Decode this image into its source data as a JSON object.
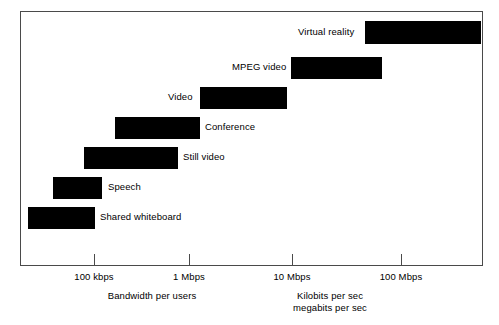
{
  "chart_data": {
    "type": "bar",
    "orientation": "horizontal",
    "title": "",
    "xlabel": "Bandwidth per users",
    "ylabel": "",
    "scale": "log",
    "xlim": [
      20000,
      500000000
    ],
    "grid": false,
    "legend": null,
    "axis_ticks": [
      {
        "label": "100 kbps",
        "value": 100000,
        "x": 94
      },
      {
        "label": "1 Mbps",
        "value": 1000000,
        "x": 189
      },
      {
        "label": "10 Mbps",
        "value": 10000000,
        "x": 292
      },
      {
        "label": "100 Mbps",
        "value": 100000000,
        "x": 401
      }
    ],
    "captions": [
      {
        "text": "Bandwidth per users",
        "x": 152,
        "y": 290
      },
      {
        "text": "Kilobits per sec",
        "x": 330,
        "y": 290
      },
      {
        "text": "megabits per sec",
        "x": 330,
        "y": 302
      }
    ],
    "categories": [
      "Virtual reality",
      "MPEG video",
      "Video",
      "Conference",
      "Still video",
      "Speech",
      "Shared whiteboard"
    ],
    "bars": [
      {
        "label": "Virtual reality",
        "start_bps": 35000000,
        "end_bps": 450000000,
        "start_label": "35 Mbps",
        "end_label": "450 Mbps",
        "px": {
          "x": 365,
          "width": 117,
          "y": 21,
          "height": 23
        },
        "label_px": {
          "x": 298,
          "y": 26
        },
        "label_align": "left",
        "clipped_right": true
      },
      {
        "label": "MPEG video",
        "start_bps": 9800000,
        "end_bps": 90000000,
        "start_label": "9.8 Mbps",
        "end_label": "90 Mbps",
        "px": {
          "x": 291,
          "width": 91,
          "y": 57,
          "height": 22
        },
        "label_px": {
          "x": 232,
          "y": 61
        },
        "label_align": "left"
      },
      {
        "label": "Video",
        "start_bps": 1250000,
        "end_bps": 8200000,
        "start_label": "1.25 Mbps",
        "end_label": "8.2 Mbps",
        "px": {
          "x": 200,
          "width": 87,
          "y": 87,
          "height": 22
        },
        "label_px": {
          "x": 168,
          "y": 91
        },
        "label_align": "left"
      },
      {
        "label": "Conference",
        "start_bps": 220000,
        "end_bps": 1250000,
        "start_label": "220 kbps",
        "end_label": "1.25 Mbps",
        "px": {
          "x": 115,
          "width": 85,
          "y": 117,
          "height": 22
        },
        "label_px": {
          "x": 205,
          "y": 121
        },
        "label_align": "left"
      },
      {
        "label": "Still video",
        "start_bps": 120000,
        "end_bps": 800000,
        "start_label": "120 kbps",
        "end_label": "800 kbps",
        "px": {
          "x": 84,
          "width": 94,
          "y": 147,
          "height": 22
        },
        "label_px": {
          "x": 183,
          "y": 151
        },
        "label_align": "left"
      },
      {
        "label": "Speech",
        "start_bps": 48000,
        "end_bps": 130000,
        "start_label": "48 kbps",
        "end_label": "130 kbps",
        "px": {
          "x": 53,
          "width": 49,
          "y": 177,
          "height": 22
        },
        "label_px": {
          "x": 108,
          "y": 181
        },
        "label_align": "left"
      },
      {
        "label": "Shared whiteboard",
        "start_bps": 32000,
        "end_bps": 102000,
        "start_label": "32 kbps",
        "end_label": "102 kbps",
        "px": {
          "x": 28,
          "width": 67,
          "y": 207,
          "height": 22
        },
        "label_px": {
          "x": 100,
          "y": 211
        },
        "label_align": "left"
      }
    ]
  },
  "colors": {
    "bar": "#000000",
    "frame": "#4a4a4a",
    "background": "#ffffff",
    "text": "#000000"
  }
}
